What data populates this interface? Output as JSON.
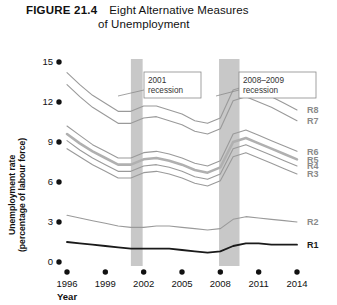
{
  "figure": {
    "number": "FIGURE 21.4",
    "title_line1": "Eight Alternative Measures",
    "title_line2": "of Unemployment"
  },
  "chart_data": {
    "type": "line",
    "title": "Eight Alternative Measures of Unemployment",
    "xlabel": "Year",
    "ylabel": "Unemployment rate (percentage of labour force)",
    "xlim": [
      1996,
      2014
    ],
    "ylim": [
      0,
      15
    ],
    "yticks": [
      0,
      3,
      6,
      9,
      12,
      15
    ],
    "xticks": [
      1996,
      1999,
      2002,
      2005,
      2008,
      2011,
      2014
    ],
    "grid": false,
    "legend_position": "right-inline",
    "x": [
      1996,
      1997,
      1998,
      1999,
      2000,
      2001,
      2002,
      2003,
      2004,
      2005,
      2006,
      2007,
      2008,
      2009,
      2010,
      2011,
      2012,
      2013,
      2014
    ],
    "series": [
      {
        "name": "R8",
        "label": "R8",
        "color": "#9a9a9a",
        "width": 1.1,
        "values": [
          14.2,
          13.3,
          12.5,
          11.9,
          11.3,
          11.3,
          11.7,
          11.7,
          11.4,
          11.1,
          10.6,
          10.4,
          10.8,
          12.9,
          13.2,
          12.8,
          12.4,
          11.9,
          11.4
        ]
      },
      {
        "name": "R7",
        "label": "R7",
        "color": "#9a9a9a",
        "width": 1.1,
        "values": [
          13.3,
          12.4,
          11.6,
          11.0,
          10.4,
          10.4,
          10.8,
          10.9,
          10.6,
          10.3,
          9.8,
          9.6,
          10.0,
          12.1,
          12.4,
          12.0,
          11.6,
          11.1,
          10.6
        ]
      },
      {
        "name": "R6",
        "label": "R6",
        "color": "#9a9a9a",
        "width": 1.1,
        "values": [
          10.2,
          9.5,
          8.8,
          8.3,
          7.8,
          7.8,
          8.2,
          8.3,
          8.1,
          7.8,
          7.4,
          7.2,
          7.6,
          9.6,
          9.9,
          9.5,
          9.1,
          8.7,
          8.3
        ]
      },
      {
        "name": "R5",
        "label": "R5",
        "color": "#b0b0b0",
        "width": 2.6,
        "values": [
          9.6,
          8.9,
          8.3,
          7.8,
          7.3,
          7.3,
          7.7,
          7.8,
          7.6,
          7.3,
          6.9,
          6.7,
          7.1,
          9.0,
          9.3,
          8.9,
          8.5,
          8.1,
          7.7
        ]
      },
      {
        "name": "R4",
        "label": "R4",
        "color": "#9a9a9a",
        "width": 1.1,
        "values": [
          9.1,
          8.4,
          7.8,
          7.3,
          6.8,
          6.8,
          7.2,
          7.3,
          7.1,
          6.8,
          6.4,
          6.2,
          6.6,
          8.5,
          8.8,
          8.4,
          8.0,
          7.6,
          7.2
        ]
      },
      {
        "name": "R3",
        "label": "R3",
        "color": "#9a9a9a",
        "width": 1.1,
        "values": [
          8.5,
          7.9,
          7.3,
          6.8,
          6.3,
          6.3,
          6.7,
          6.8,
          6.6,
          6.3,
          5.9,
          5.7,
          6.1,
          7.9,
          8.2,
          7.8,
          7.4,
          7.0,
          6.6
        ]
      },
      {
        "name": "R2",
        "label": "R2",
        "color": "#9a9a9a",
        "width": 1.1,
        "values": [
          3.5,
          3.3,
          3.1,
          2.9,
          2.7,
          2.6,
          2.6,
          2.7,
          2.7,
          2.6,
          2.5,
          2.4,
          2.5,
          3.2,
          3.4,
          3.3,
          3.2,
          3.1,
          3.0
        ]
      },
      {
        "name": "R1",
        "label": "R1",
        "color": "#1a1a1a",
        "width": 1.8,
        "values": [
          1.5,
          1.4,
          1.3,
          1.2,
          1.1,
          1.0,
          1.0,
          1.0,
          1.0,
          0.9,
          0.8,
          0.7,
          0.8,
          1.2,
          1.4,
          1.4,
          1.3,
          1.3,
          1.3
        ]
      }
    ],
    "shaded_regions": [
      {
        "name": "2001 recession",
        "start": 2001.0,
        "end": 2001.92,
        "color": "#c8c8c8"
      },
      {
        "name": "2008-2009 recession",
        "start": 2007.9,
        "end": 2009.5,
        "color": "#c8c8c8"
      }
    ],
    "annotations": [
      {
        "name": "recession-2001",
        "line1": "2001",
        "line2": "recession"
      },
      {
        "name": "recession-2008-2009",
        "line1": "2008–2009",
        "line2": "recession"
      }
    ]
  }
}
